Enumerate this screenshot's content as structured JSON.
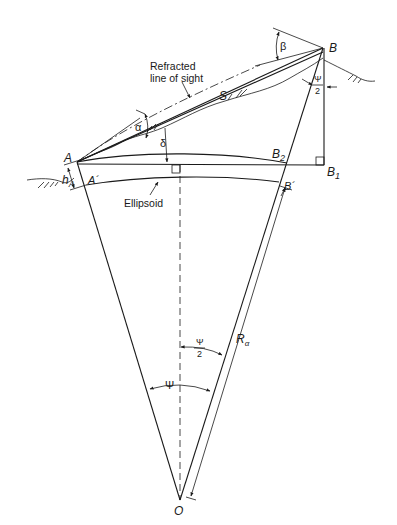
{
  "figure": {
    "labels": {
      "refracted_1": "Refracted",
      "refracted_2": "line of sight",
      "point_a": "A",
      "point_a_prime": "A´",
      "point_b": "B",
      "point_b1": "B",
      "point_b1_sub": "1",
      "point_b2": "B",
      "point_b2_sub": "2",
      "point_b_prime": "B´",
      "point_o": "O",
      "slope_distance": "S",
      "alpha": "α",
      "beta": "β",
      "delta": "δ",
      "h_a": "h",
      "h_a_sub": "A",
      "ellipsoid": "Ellipsoid",
      "psi": "Ψ",
      "psi_half_num": "Ψ",
      "psi_half_den": "2",
      "top_psi_half_num": "Ψ",
      "top_psi_half_den": "2",
      "radius": "R",
      "radius_sub": "α"
    },
    "stroke_color": "#1a1a1a",
    "background": "#ffffff"
  }
}
